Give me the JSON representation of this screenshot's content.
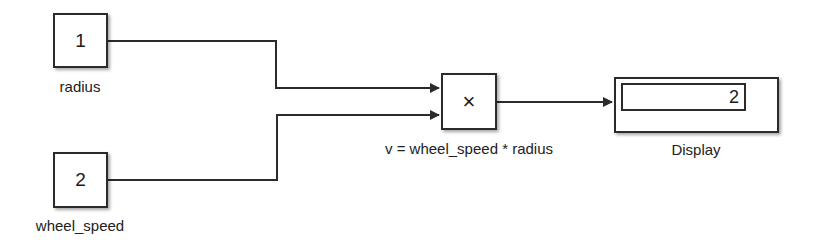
{
  "diagram": {
    "blocks": {
      "inport_radius": {
        "value": "1",
        "label": "radius"
      },
      "inport_wheel_speed": {
        "value": "2",
        "label": "wheel_speed"
      },
      "product": {
        "symbol": "×",
        "label": "v = wheel_speed * radius"
      },
      "display": {
        "value": "2",
        "label": "Display"
      }
    },
    "colors": {
      "line": "#2b2b2b",
      "background": "#ffffff"
    }
  }
}
